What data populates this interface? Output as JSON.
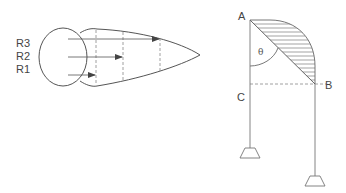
{
  "left_figure": {
    "labels": {
      "r3": "R3",
      "r2": "R2",
      "r1": "R1"
    }
  },
  "right_figure": {
    "labels": {
      "a": "A",
      "b": "B",
      "c": "C",
      "theta": "θ"
    }
  },
  "colors": {
    "stroke": "#555555",
    "dashed": "#888888",
    "hatch": "#666666",
    "support": "#777777"
  }
}
